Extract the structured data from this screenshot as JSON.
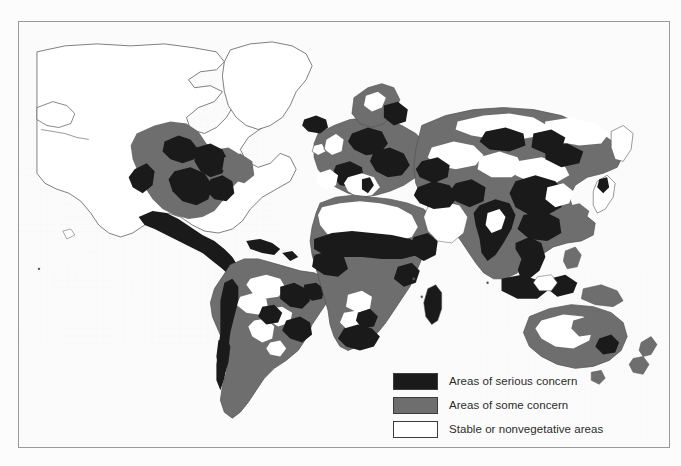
{
  "figure": {
    "type": "thematic-world-map",
    "title": "",
    "frame_border_color": "#9a9a9a",
    "background_color": "#fcfcfc"
  },
  "legend": {
    "position": "bottom-center",
    "items": [
      {
        "id": "serious",
        "label": "Areas of serious concern",
        "color": "#1a1a1a",
        "swatch_border": "#3c3c3c"
      },
      {
        "id": "some",
        "label": "Areas of some concern",
        "color": "#6e6e6e",
        "swatch_border": "#3c3c3c"
      },
      {
        "id": "stable",
        "label": "Stable or nonvegetative areas",
        "color": "#ffffff",
        "swatch_border": "#3c3c3c"
      }
    ]
  },
  "map": {
    "coastline_color": "#555555",
    "ocean_color": "#fbfbfb",
    "land_default_color": "#ffffff",
    "regions": [
      {
        "name": "greenland",
        "class": "stable"
      },
      {
        "name": "canada-arctic",
        "class": "stable"
      },
      {
        "name": "western-north-america",
        "class": "some"
      },
      {
        "name": "great-plains-usa",
        "class": "serious"
      },
      {
        "name": "mexico-central-america",
        "class": "serious"
      },
      {
        "name": "caribbean",
        "class": "serious"
      },
      {
        "name": "amazon-basin",
        "class": "some"
      },
      {
        "name": "andes",
        "class": "serious"
      },
      {
        "name": "brazilian-highlands",
        "class": "some"
      },
      {
        "name": "patagonia",
        "class": "some"
      },
      {
        "name": "iceland",
        "class": "serious"
      },
      {
        "name": "scandinavia",
        "class": "some"
      },
      {
        "name": "western-europe",
        "class": "some"
      },
      {
        "name": "mediterranean-europe",
        "class": "serious"
      },
      {
        "name": "eastern-europe",
        "class": "serious"
      },
      {
        "name": "sahara",
        "class": "stable"
      },
      {
        "name": "sahel",
        "class": "serious"
      },
      {
        "name": "west-africa",
        "class": "some"
      },
      {
        "name": "horn-of-africa",
        "class": "serious"
      },
      {
        "name": "southern-africa",
        "class": "some"
      },
      {
        "name": "south-africa",
        "class": "serious"
      },
      {
        "name": "madagascar",
        "class": "serious"
      },
      {
        "name": "arabian-peninsula",
        "class": "stable"
      },
      {
        "name": "middle-east",
        "class": "serious"
      },
      {
        "name": "central-asia",
        "class": "some"
      },
      {
        "name": "siberia",
        "class": "some"
      },
      {
        "name": "gobi-desert",
        "class": "stable"
      },
      {
        "name": "india",
        "class": "serious"
      },
      {
        "name": "china-loess",
        "class": "serious"
      },
      {
        "name": "southeast-asia",
        "class": "serious"
      },
      {
        "name": "indonesia",
        "class": "serious"
      },
      {
        "name": "japan",
        "class": "stable"
      },
      {
        "name": "australia-interior",
        "class": "stable"
      },
      {
        "name": "australia-coastal",
        "class": "some"
      },
      {
        "name": "australia-southeast",
        "class": "serious"
      },
      {
        "name": "new-zealand",
        "class": "some"
      }
    ]
  }
}
